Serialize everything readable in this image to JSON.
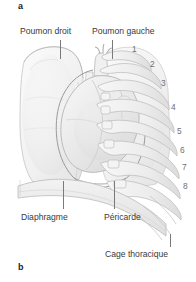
{
  "figure": {
    "panel_top_letter": "a",
    "panel_bottom_letter": "b",
    "description_alt": "Anatomical line drawing of the human thorax showing lungs, heart, pericardium, diaphragm and rib cage"
  },
  "labels": {
    "lung_right": "Poumon droit",
    "lung_left": "Poumon gauche",
    "diaphragm": "Diaphragme",
    "pericardium": "Péricarde",
    "rib_cage": "Cage thoracique"
  },
  "rib_numbers": [
    "1",
    "2",
    "3",
    "4",
    "5",
    "6",
    "7",
    "8"
  ],
  "colors": {
    "background": "#ffffff",
    "label_text": "#3a3a3a",
    "rib_number_text": "#6f6f6f",
    "panel_letter_text": "#1b1b1b",
    "leader_line": "#7a7a7a",
    "art_outline": "#b9b9b9",
    "art_fill_light": "#f4f4f4",
    "art_fill_mid": "#e6e6e6",
    "art_shadow": "#d2d2d2"
  }
}
